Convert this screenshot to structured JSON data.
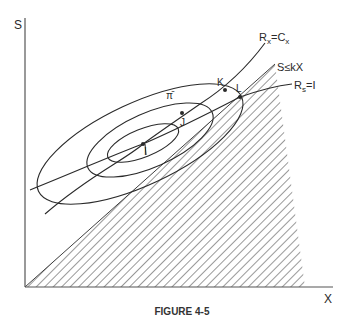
{
  "figure": {
    "caption": "FIGURE 4-5",
    "axes": {
      "y_label": "S",
      "x_label": "X"
    },
    "curves": {
      "rx_label_main": "R",
      "rx_label_sub": "x",
      "rx_label_eq": "=C",
      "rx_label_sub2": "x",
      "rs_label_main": "R",
      "rs_label_sub": "s",
      "rs_label_eq": "=I",
      "constraint_label": "S≤kX",
      "isoprofit_label": "π̄"
    },
    "points": [
      {
        "name": "I",
        "label": "I"
      },
      {
        "name": "J",
        "label": "J"
      },
      {
        "name": "K",
        "label": "K"
      },
      {
        "name": "L",
        "label": "L"
      }
    ],
    "colors": {
      "ink": "#2a2a2a",
      "background": "#ffffff"
    }
  }
}
